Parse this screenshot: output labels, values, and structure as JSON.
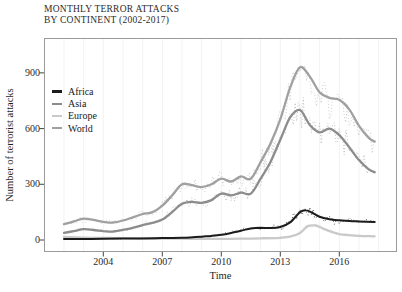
{
  "title": {
    "line1": "MONTHLY TERROR ATTACKS",
    "line2": "BY CONTINENT (2002-2017)"
  },
  "axes": {
    "x": {
      "label": "Time"
    },
    "y": {
      "label": "Number of terrorist attacks"
    }
  },
  "legend": {
    "position": "inside-left",
    "items": [
      "Africa",
      "Asia",
      "Europe",
      "World"
    ]
  },
  "frame_color": "#9a9a9a",
  "tick_color": "#444444",
  "chart_data": {
    "type": "line",
    "title": "MONTHLY TERROR ATTACKS BY CONTINENT (2002-2017)",
    "xlabel": "Time",
    "ylabel": "Number of terrorist attacks",
    "x_ticks": [
      2004,
      2007,
      2010,
      2013,
      2016
    ],
    "y_ticks": [
      0,
      300,
      600,
      900
    ],
    "x_range": [
      2002,
      2017.8
    ],
    "ylim": [
      0,
      1100
    ],
    "grid": false,
    "legend_position": "inside-left",
    "style": "smoothed trend lines with dotted raw monthly series scattered around them",
    "series": [
      {
        "name": "World",
        "color": "#a0a0a0",
        "noise_frac": 0.2,
        "x": [
          2002,
          2002.5,
          2003,
          2003.5,
          2004,
          2004.5,
          2005,
          2005.5,
          2006,
          2006.5,
          2007,
          2007.5,
          2008,
          2008.5,
          2009,
          2009.5,
          2010,
          2010.5,
          2011,
          2011.5,
          2012,
          2012.5,
          2013,
          2013.5,
          2014,
          2014.5,
          2015,
          2015.5,
          2016,
          2016.5,
          2017,
          2017.5,
          2017.8
        ],
        "y": [
          85,
          100,
          115,
          108,
          98,
          94,
          105,
          122,
          140,
          150,
          185,
          240,
          300,
          295,
          285,
          300,
          330,
          315,
          342,
          330,
          420,
          520,
          650,
          820,
          930,
          880,
          795,
          765,
          755,
          705,
          615,
          550,
          530
        ]
      },
      {
        "name": "Asia",
        "color": "#8c8c8c",
        "noise_frac": 0.2,
        "x": [
          2002,
          2002.5,
          2003,
          2003.5,
          2004,
          2004.5,
          2005,
          2005.5,
          2006,
          2006.5,
          2007,
          2007.5,
          2008,
          2008.5,
          2009,
          2009.5,
          2010,
          2010.5,
          2011,
          2011.5,
          2012,
          2012.5,
          2013,
          2013.5,
          2014,
          2014.5,
          2015,
          2015.5,
          2016,
          2016.5,
          2017,
          2017.5,
          2017.8
        ],
        "y": [
          38,
          48,
          58,
          54,
          48,
          46,
          55,
          65,
          80,
          92,
          110,
          150,
          195,
          205,
          200,
          215,
          250,
          240,
          255,
          250,
          330,
          420,
          540,
          660,
          700,
          620,
          580,
          600,
          565,
          500,
          430,
          380,
          365
        ]
      },
      {
        "name": "Europe",
        "color": "#c9c9c9",
        "noise_frac": 0.3,
        "x": [
          2002,
          2003,
          2004,
          2005,
          2006,
          2007,
          2008,
          2009,
          2010,
          2011,
          2012,
          2013,
          2013.5,
          2014,
          2014.4,
          2014.8,
          2015,
          2015.5,
          2016,
          2016.5,
          2017,
          2017.8
        ],
        "y": [
          16,
          13,
          11,
          10,
          9,
          8,
          7,
          6,
          6,
          7,
          9,
          12,
          18,
          38,
          75,
          78,
          70,
          48,
          32,
          26,
          22,
          20
        ]
      },
      {
        "name": "Africa",
        "color": "#1c1c1c",
        "noise_frac": 0.28,
        "x": [
          2002,
          2003,
          2004,
          2005,
          2006,
          2007,
          2008,
          2009,
          2009.5,
          2010,
          2010.5,
          2011,
          2011.5,
          2012,
          2012.5,
          2013,
          2013.5,
          2014,
          2014.3,
          2014.6,
          2015,
          2015.5,
          2016,
          2016.5,
          2017,
          2017.8
        ],
        "y": [
          6,
          6,
          7,
          8,
          8,
          10,
          12,
          18,
          22,
          28,
          38,
          50,
          62,
          66,
          64,
          70,
          95,
          150,
          160,
          148,
          125,
          112,
          106,
          103,
          100,
          97
        ]
      }
    ]
  }
}
